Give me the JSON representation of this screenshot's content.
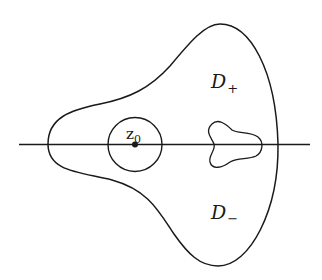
{
  "figure": {
    "colors": {
      "stroke": "#1a1a1a",
      "background": "#ffffff"
    },
    "labels": {
      "point": {
        "base": "z",
        "sub": "0"
      },
      "upper_region": {
        "base": "D",
        "sub": "+"
      },
      "lower_region": {
        "base": "D",
        "sub": "−"
      }
    },
    "elements": [
      {
        "name": "real-axis",
        "type": "line"
      },
      {
        "name": "outer-boundary",
        "type": "closed-curve"
      },
      {
        "name": "disc-around-z0",
        "type": "circle"
      },
      {
        "name": "center-point-z0",
        "type": "dot"
      },
      {
        "name": "inner-hole",
        "type": "closed-curve"
      }
    ]
  }
}
